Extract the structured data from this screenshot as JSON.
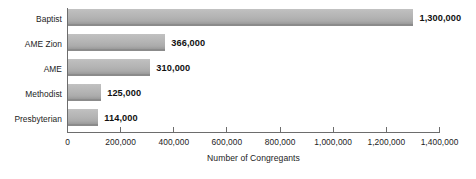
{
  "chart_data": {
    "type": "bar",
    "orientation": "horizontal",
    "title": "",
    "subtitle": "",
    "xlabel": "Number of Congregants",
    "ylabel": "",
    "categories": [
      "Baptist",
      "AME Zion",
      "AME",
      "Methodist",
      "Presbyterian"
    ],
    "values": [
      1300000,
      366000,
      310000,
      125000,
      114000
    ],
    "value_labels": [
      "1,300,000",
      "366,000",
      "310,000",
      "125,000",
      "114,000"
    ],
    "xlim": [
      0,
      1400000
    ],
    "xticks": [
      0,
      200000,
      400000,
      600000,
      800000,
      1000000,
      1200000,
      1400000
    ],
    "xtick_labels": [
      "0",
      "200,000",
      "400,000",
      "600,000",
      "800,000",
      "1,000,000",
      "1,200,000",
      "1,400,000"
    ],
    "grid": false,
    "legend": null,
    "bar_color": "#b4b4b4",
    "bar_edge_color": "#8b8b8b",
    "axis_color": "#6d6d6d",
    "text_color": "#1c1c1c",
    "background": "#ffffff"
  }
}
